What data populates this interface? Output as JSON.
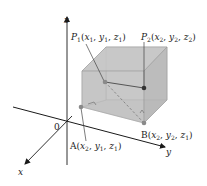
{
  "diagram": {
    "type": "3d-coordinate-box",
    "axes": {
      "x_label": "x",
      "y_label": "y",
      "z_label": "z",
      "origin_label": "0"
    },
    "points": [
      {
        "id": "P1",
        "name": "P",
        "sub": "1",
        "coords": [
          {
            "v": "x",
            "s": "1"
          },
          {
            "v": "y",
            "s": "1"
          },
          {
            "v": "z",
            "s": "1"
          }
        ],
        "label": "P1(x1, y1, z1)"
      },
      {
        "id": "P2",
        "name": "P",
        "sub": "2",
        "coords": [
          {
            "v": "x",
            "s": "2"
          },
          {
            "v": "y",
            "s": "2"
          },
          {
            "v": "z",
            "s": "2"
          }
        ],
        "label": "P2(x2, y2, z2)"
      },
      {
        "id": "A",
        "name": "A",
        "sub": "",
        "coords": [
          {
            "v": "x",
            "s": "2"
          },
          {
            "v": "y",
            "s": "1"
          },
          {
            "v": "z",
            "s": "1"
          }
        ],
        "label": "A(x2, y1, z1)"
      },
      {
        "id": "B",
        "name": "B",
        "sub": "",
        "coords": [
          {
            "v": "x",
            "s": "2"
          },
          {
            "v": "y",
            "s": "2"
          },
          {
            "v": "z",
            "s": "1"
          }
        ],
        "label": "B(x2, y2, z1)"
      }
    ],
    "colors": {
      "box_fill": "#c8c8c8",
      "box_edge": "#9a9a9a",
      "axis": "#1a1a1a",
      "point": "#888888",
      "point_dark": "#333333",
      "background": "#ffffff"
    }
  }
}
